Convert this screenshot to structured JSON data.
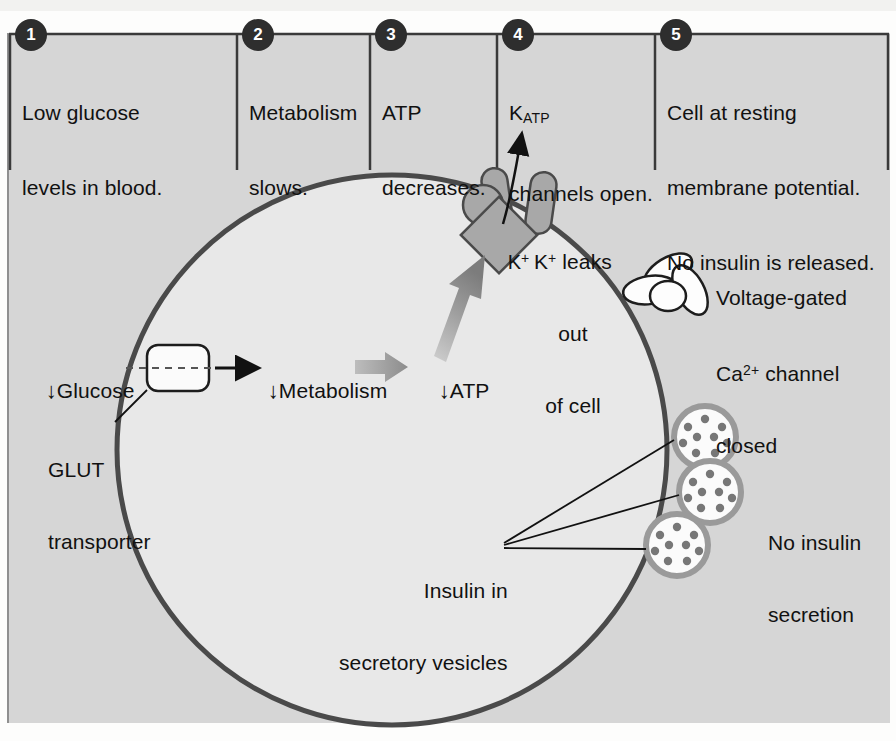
{
  "figure": {
    "panel_bg": "#d6d6d6",
    "cell_fill": "#e6e6e6",
    "membrane_color": "#5b5b5b",
    "accent_gray": "#9a9a9a",
    "text_color": "#111111",
    "badge_color": "#2e2e2e",
    "page_bg": "#fdfdfc",
    "cut_off_header": "·"
  },
  "steps": [
    {
      "number": "1",
      "line1": "Low glucose",
      "line2": "levels in blood.",
      "line3": ""
    },
    {
      "number": "2",
      "line1": "Metabolism",
      "line2": "slows.",
      "line3": ""
    },
    {
      "number": "3",
      "line1": "ATP",
      "line2": "decreases.",
      "line3": ""
    },
    {
      "number": "4",
      "line1": "K",
      "line1_sub": "ATP",
      "line2": "channels open.",
      "line3": ""
    },
    {
      "number": "5",
      "line1": "Cell at resting",
      "line2": "membrane potential.",
      "line3": "No insulin is released."
    }
  ],
  "labels": {
    "glucose": "Glucose",
    "glucose_arrow": "↓",
    "metabolism": "Metabolism",
    "metabolism_arrow": "↓",
    "atp": "ATP",
    "atp_arrow": "↓",
    "glut_line1": "GLUT",
    "glut_line2": "transporter",
    "k_ion": "K",
    "k_ion_charge": "+",
    "k_leak_line1": "K",
    "k_leak_charge": "+",
    "k_leak_line1b": " leaks",
    "k_leak_line2": "out",
    "k_leak_line3": "of cell",
    "ca_channel_line1": "Voltage-gated",
    "ca_channel_line2a": "Ca",
    "ca_channel_line2sup": "2+",
    "ca_channel_line2b": " channel",
    "ca_channel_line3": "closed",
    "insulin_line1": "Insulin in",
    "insulin_line2": "secretory vesicles",
    "no_secretion_line1": "No insulin",
    "no_secretion_line2": "secretion"
  },
  "diagram_elements": {
    "katp_channel_state": "open",
    "ca_channel_state": "closed",
    "vesicle_count": 3,
    "granules_per_vesicle": 9,
    "membrane_potential": "resting",
    "insulin_released": "none"
  }
}
